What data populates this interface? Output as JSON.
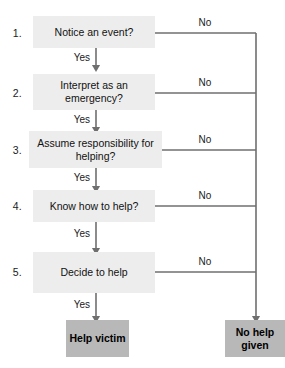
{
  "diagram": {
    "colors": {
      "step_fill": "#ededed",
      "terminal_fill": "#b8b8b8",
      "line": "#6f6f6f",
      "text": "#121212",
      "background": "#ffffff"
    },
    "yes_label": "Yes",
    "no_label": "No",
    "steps": [
      {
        "number": "1.",
        "text": "Notice an event?",
        "yes": "Yes",
        "no": "No"
      },
      {
        "number": "2.",
        "text": "Interpret as an emergency?",
        "yes": "Yes",
        "no": "No"
      },
      {
        "number": "3.",
        "text": "Assume responsibility for helping?",
        "yes": "Yes",
        "no": "No"
      },
      {
        "number": "4.",
        "text": "Know how to help?",
        "yes": "Yes",
        "no": "No"
      },
      {
        "number": "5.",
        "text": "Decide to help",
        "yes": "Yes",
        "no": "No"
      }
    ],
    "outcomes": {
      "positive": "Help victim",
      "negative": "No help given"
    }
  }
}
